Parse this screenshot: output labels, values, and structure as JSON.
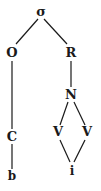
{
  "diagram": {
    "type": "syllable-tree",
    "nodes": {
      "root": {
        "label": "σ",
        "x": 41,
        "y": 16
      },
      "onset": {
        "label": "O",
        "x": 12,
        "y": 57
      },
      "rhyme": {
        "label": "R",
        "x": 71,
        "y": 57
      },
      "nucleus": {
        "label": "N",
        "x": 71,
        "y": 99
      },
      "onset_c": {
        "label": "C",
        "x": 12,
        "y": 141
      },
      "v_left": {
        "label": "V",
        "x": 58,
        "y": 136
      },
      "v_right": {
        "label": "V",
        "x": 87,
        "y": 136
      },
      "seg_b": {
        "label": "b",
        "x": 12,
        "y": 180
      },
      "seg_i": {
        "label": "i",
        "x": 72,
        "y": 175
      }
    },
    "edges": [
      [
        "root",
        "onset"
      ],
      [
        "root",
        "rhyme"
      ],
      [
        "onset",
        "onset_c"
      ],
      [
        "onset_c",
        "seg_b"
      ],
      [
        "rhyme",
        "nucleus"
      ],
      [
        "nucleus",
        "v_left"
      ],
      [
        "nucleus",
        "v_right"
      ],
      [
        "v_left",
        "seg_i"
      ],
      [
        "v_right",
        "seg_i"
      ]
    ]
  }
}
